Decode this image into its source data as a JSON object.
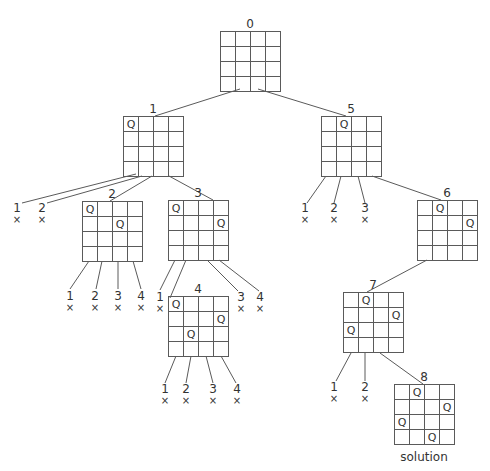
{
  "colors": {
    "line": "#5a5a5a",
    "text": "#333333",
    "background": "#ffffff"
  },
  "board_size": 4,
  "cell_px": 15,
  "queen_glyph": "Q",
  "fail_glyph": "×",
  "nodes": [
    {
      "id": "0",
      "label": "0",
      "x": 220,
      "y": 31,
      "queens": []
    },
    {
      "id": "1",
      "label": "1",
      "x": 123,
      "y": 116,
      "queens": [
        [
          0,
          0
        ]
      ]
    },
    {
      "id": "2",
      "label": "2",
      "x": 82,
      "y": 201,
      "queens": [
        [
          0,
          0
        ],
        [
          1,
          2
        ]
      ]
    },
    {
      "id": "3",
      "label": "3",
      "x": 168,
      "y": 200,
      "queens": [
        [
          0,
          0
        ],
        [
          1,
          3
        ]
      ]
    },
    {
      "id": "4",
      "label": "4",
      "x": 168,
      "y": 296,
      "queens": [
        [
          0,
          0
        ],
        [
          1,
          3
        ],
        [
          2,
          1
        ]
      ]
    },
    {
      "id": "5",
      "label": "5",
      "x": 321,
      "y": 116,
      "queens": [
        [
          0,
          1
        ]
      ]
    },
    {
      "id": "6",
      "label": "6",
      "x": 417,
      "y": 200,
      "queens": [
        [
          0,
          1
        ],
        [
          1,
          3
        ]
      ]
    },
    {
      "id": "7",
      "label": "7",
      "x": 343,
      "y": 292,
      "queens": [
        [
          0,
          1
        ],
        [
          1,
          3
        ],
        [
          2,
          0
        ]
      ]
    },
    {
      "id": "8",
      "label": "8",
      "x": 394,
      "y": 384,
      "queens": [
        [
          0,
          1
        ],
        [
          1,
          3
        ],
        [
          2,
          0
        ],
        [
          3,
          2
        ]
      ],
      "caption": "solution"
    }
  ],
  "edges": [
    {
      "from": "0",
      "to": "1",
      "x1": 240,
      "y1": 89,
      "x2": 155,
      "y2": 116
    },
    {
      "from": "0",
      "to": "5",
      "x1": 258,
      "y1": 89,
      "x2": 346,
      "y2": 116
    },
    {
      "from": "1",
      "to": "2",
      "x1": 152,
      "y1": 176,
      "x2": 110,
      "y2": 201
    },
    {
      "from": "1",
      "to": "3",
      "x1": 169,
      "y1": 176,
      "x2": 213,
      "y2": 200
    },
    {
      "from": "3",
      "to": "4",
      "x1": 186,
      "y1": 260,
      "x2": 170,
      "y2": 298
    },
    {
      "from": "5",
      "to": "6",
      "x1": 372,
      "y1": 176,
      "x2": 441,
      "y2": 200
    },
    {
      "from": "6",
      "to": "7",
      "x1": 427,
      "y1": 260,
      "x2": 367,
      "y2": 292
    },
    {
      "from": "7",
      "to": "8",
      "x1": 380,
      "y1": 353,
      "x2": 423,
      "y2": 384
    }
  ],
  "failed_branches": [
    {
      "parent": "1",
      "label": "1",
      "x1": 136,
      "y1": 174,
      "x2": 22,
      "y2": 203,
      "tx": 17,
      "ty": 212
    },
    {
      "parent": "1",
      "label": "2",
      "x1": 142,
      "y1": 176,
      "x2": 47,
      "y2": 203,
      "tx": 42,
      "ty": 212
    },
    {
      "parent": "2",
      "label": "1",
      "x1": 89,
      "y1": 261,
      "x2": 70,
      "y2": 289,
      "tx": 70,
      "ty": 300
    },
    {
      "parent": "2",
      "label": "2",
      "x1": 102,
      "y1": 261,
      "x2": 96,
      "y2": 289,
      "tx": 95,
      "ty": 300
    },
    {
      "parent": "2",
      "label": "3",
      "x1": 118,
      "y1": 261,
      "x2": 118,
      "y2": 289,
      "tx": 118,
      "ty": 300
    },
    {
      "parent": "2",
      "label": "4",
      "x1": 133,
      "y1": 261,
      "x2": 141,
      "y2": 289,
      "tx": 141,
      "ty": 300
    },
    {
      "parent": "3",
      "label": "1",
      "x1": 175,
      "y1": 260,
      "x2": 160,
      "y2": 290,
      "tx": 160,
      "ty": 301
    },
    {
      "parent": "3",
      "label": "3",
      "x1": 207,
      "y1": 260,
      "x2": 238,
      "y2": 291,
      "tx": 241,
      "ty": 301
    },
    {
      "parent": "3",
      "label": "4",
      "x1": 219,
      "y1": 260,
      "x2": 259,
      "y2": 291,
      "tx": 260,
      "ty": 301
    },
    {
      "parent": "4",
      "label": "1",
      "x1": 176,
      "y1": 356,
      "x2": 165,
      "y2": 383,
      "tx": 165,
      "ty": 393
    },
    {
      "parent": "4",
      "label": "2",
      "x1": 191,
      "y1": 356,
      "x2": 186,
      "y2": 383,
      "tx": 186,
      "ty": 393
    },
    {
      "parent": "4",
      "label": "3",
      "x1": 206,
      "y1": 356,
      "x2": 213,
      "y2": 383,
      "tx": 213,
      "ty": 393
    },
    {
      "parent": "4",
      "label": "4",
      "x1": 221,
      "y1": 356,
      "x2": 236,
      "y2": 383,
      "tx": 237,
      "ty": 393
    },
    {
      "parent": "5",
      "label": "1",
      "x1": 326,
      "y1": 176,
      "x2": 307,
      "y2": 203,
      "tx": 305,
      "ty": 212
    },
    {
      "parent": "5",
      "label": "2",
      "x1": 341,
      "y1": 176,
      "x2": 334,
      "y2": 203,
      "tx": 334,
      "ty": 212
    },
    {
      "parent": "5",
      "label": "3",
      "x1": 358,
      "y1": 176,
      "x2": 365,
      "y2": 203,
      "tx": 365,
      "ty": 212
    },
    {
      "parent": "7",
      "label": "1",
      "x1": 351,
      "y1": 353,
      "x2": 336,
      "y2": 381,
      "tx": 334,
      "ty": 391
    },
    {
      "parent": "7",
      "label": "2",
      "x1": 365,
      "y1": 353,
      "x2": 365,
      "y2": 381,
      "tx": 365,
      "ty": 391
    }
  ]
}
